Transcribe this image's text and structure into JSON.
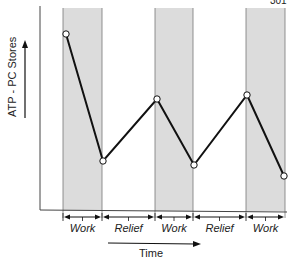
{
  "page_header": {
    "page_number": "301"
  },
  "chart_data": {
    "type": "line",
    "title": "",
    "xlabel": "Time",
    "ylabel": "ATP - PC Stores",
    "grid": false,
    "legend": null,
    "phases": [
      {
        "label": "Work",
        "shaded": true,
        "x0": 63,
        "x1": 102
      },
      {
        "label": "Relief",
        "shaded": false,
        "x0": 102,
        "x1": 155
      },
      {
        "label": "Work",
        "shaded": true,
        "x0": 155,
        "x1": 193
      },
      {
        "label": "Relief",
        "shaded": false,
        "x0": 193,
        "x1": 246
      },
      {
        "label": "Work",
        "shaded": true,
        "x0": 246,
        "x1": 285
      }
    ],
    "series": [
      {
        "name": "ATP-PC stores",
        "points_px": [
          [
            66,
            34
          ],
          [
            103,
            161
          ],
          [
            157,
            99
          ],
          [
            194,
            165
          ],
          [
            247,
            95
          ],
          [
            284,
            176
          ]
        ],
        "relative_level": [
          0.92,
          0.25,
          0.58,
          0.23,
          0.6,
          0.18
        ]
      }
    ],
    "annotations": [
      "Stores fall during work phases and partially recover during relief phases"
    ],
    "colors": {
      "shade": "#dcdcdc",
      "line": "#111111",
      "axis": "#333333"
    }
  }
}
